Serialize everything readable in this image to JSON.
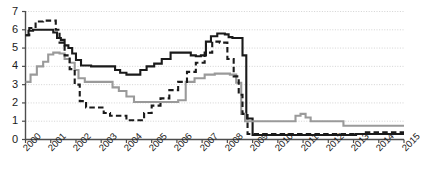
{
  "chart_data": {
    "type": "line",
    "title": "",
    "subtitle": "",
    "xlabel": "",
    "ylabel": "",
    "xlim": [
      2000,
      2015
    ],
    "ylim": [
      0,
      7
    ],
    "grid": true,
    "legend_position": "none",
    "y_ticks": [
      0,
      1,
      2,
      3,
      4,
      5,
      6,
      7
    ],
    "y_tick_labels": [
      "0",
      "1",
      "2",
      "3",
      "4",
      "5",
      "6",
      "7"
    ],
    "x_ticks": [
      2000,
      2001,
      2002,
      2003,
      2004,
      2005,
      2006,
      2007,
      2008,
      2009,
      2010,
      2011,
      2012,
      2013,
      2014,
      2015
    ],
    "x_tick_labels": [
      "2000",
      "2001",
      "2002",
      "2003",
      "2004",
      "2005",
      "2006",
      "2007",
      "2008",
      "2009",
      "2010",
      "2011",
      "2012",
      "2013",
      "2014",
      "2015"
    ],
    "annotations": [],
    "series": [
      {
        "name": "series-black-solid",
        "color": "#1a1a1a",
        "style": "solid",
        "width": 2.1,
        "step": true,
        "x": [
          2000.0,
          2000.12,
          2000.3,
          2000.5,
          2001.0,
          2001.1,
          2001.25,
          2001.4,
          2001.55,
          2001.7,
          2001.85,
          2002.0,
          2002.2,
          2002.6,
          2003.2,
          2003.55,
          2003.75,
          2004.0,
          2004.25,
          2004.55,
          2004.8,
          2005.1,
          2005.4,
          2005.75,
          2006.1,
          2006.4,
          2006.55,
          2006.75,
          2006.95,
          2007.15,
          2007.35,
          2007.6,
          2007.9,
          2008.05,
          2008.2,
          2008.45,
          2008.6,
          2008.75,
          2009.0,
          2012.9,
          2013.1,
          2015.0
        ],
        "y": [
          5.7,
          5.95,
          6.0,
          6.0,
          6.0,
          5.85,
          5.55,
          5.45,
          5.15,
          5.0,
          4.7,
          4.35,
          4.05,
          4.0,
          4.0,
          3.8,
          3.65,
          3.55,
          3.55,
          3.8,
          4.0,
          4.15,
          4.4,
          4.75,
          4.75,
          4.75,
          4.6,
          4.55,
          4.6,
          5.35,
          5.65,
          5.8,
          5.75,
          5.6,
          5.55,
          5.55,
          4.6,
          1.15,
          0.25,
          0.25,
          0.3,
          0.3
        ]
      },
      {
        "name": "series-gray-solid",
        "color": "#9a9a9a",
        "style": "solid",
        "width": 2.1,
        "step": true,
        "x": [
          2000.0,
          2000.2,
          2000.45,
          2000.7,
          2000.9,
          2001.1,
          2001.35,
          2001.55,
          2001.75,
          2001.95,
          2002.1,
          2002.35,
          2002.7,
          2003.2,
          2003.45,
          2003.7,
          2004.0,
          2004.3,
          2004.75,
          2005.2,
          2005.55,
          2005.8,
          2006.05,
          2006.35,
          2006.7,
          2007.1,
          2007.5,
          2007.9,
          2008.1,
          2008.35,
          2008.55,
          2008.7,
          2009.0,
          2010.45,
          2010.7,
          2010.9,
          2011.1,
          2011.3,
          2012.4,
          2012.6,
          2015.0
        ],
        "y": [
          3.15,
          3.55,
          4.0,
          4.25,
          4.65,
          4.75,
          4.7,
          4.4,
          4.2,
          3.8,
          3.35,
          3.15,
          3.15,
          3.15,
          2.85,
          2.65,
          2.35,
          2.05,
          2.05,
          2.05,
          2.05,
          2.05,
          2.15,
          3.15,
          3.35,
          3.55,
          3.6,
          3.6,
          3.55,
          3.1,
          1.4,
          1.0,
          1.0,
          1.0,
          1.3,
          1.4,
          1.2,
          1.0,
          1.0,
          0.75,
          0.75
        ]
      },
      {
        "name": "series-black-dashed",
        "color": "#1a1a1a",
        "style": "dashed",
        "width": 2.1,
        "step": true,
        "x": [
          2000.0,
          2000.15,
          2000.4,
          2000.7,
          2001.0,
          2001.2,
          2001.35,
          2001.55,
          2001.75,
          2001.95,
          2002.15,
          2002.4,
          2002.8,
          2003.1,
          2003.35,
          2003.6,
          2004.0,
          2004.4,
          2004.7,
          2005.0,
          2005.35,
          2005.7,
          2006.05,
          2006.4,
          2006.75,
          2007.1,
          2007.4,
          2007.7,
          2008.0,
          2008.25,
          2008.45,
          2008.6,
          2008.8,
          2013.2,
          2013.4,
          2015.0
        ],
        "y": [
          5.7,
          6.1,
          6.45,
          6.5,
          6.5,
          6.0,
          5.3,
          4.6,
          3.85,
          3.0,
          2.1,
          1.75,
          1.75,
          1.45,
          1.3,
          1.3,
          1.05,
          1.05,
          1.45,
          1.85,
          2.25,
          2.7,
          3.15,
          3.7,
          4.2,
          4.75,
          5.35,
          5.3,
          4.4,
          3.45,
          2.45,
          1.4,
          0.3,
          0.3,
          0.4,
          0.4
        ]
      }
    ]
  },
  "axes": {
    "y_axis_name": "y-axis",
    "x_axis_name": "x-axis"
  }
}
